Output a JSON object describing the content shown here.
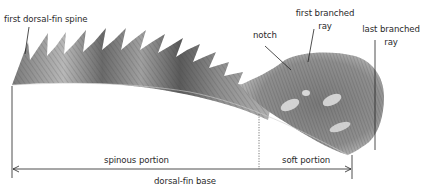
{
  "figure": {
    "labels": {
      "first_dorsal_fin_spine": "first dorsal-fin spine",
      "notch": "notch",
      "first_branched_ray_line1": "first branched",
      "first_branched_ray_line2": "ray",
      "last_branched_ray_line1": "last branched",
      "last_branched_ray_line2": "ray",
      "spinous_portion": "spinous portion",
      "soft_portion": "soft portion",
      "dorsal_fin_base": "dorsal-fin base"
    },
    "colors": {
      "background": "#ffffff",
      "line": "#222222",
      "fin_dark": "#4a4a4a",
      "fin_mid": "#8a8a8a",
      "fin_light": "#d4d4d4"
    }
  }
}
